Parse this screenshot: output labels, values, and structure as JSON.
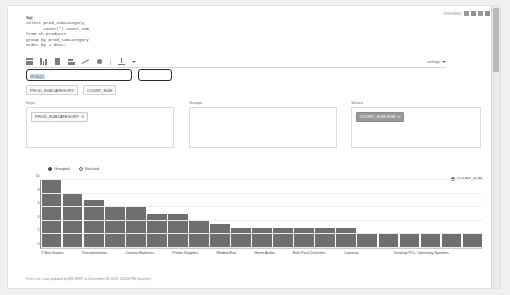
{
  "window": {
    "topbar_label": "FINISHED",
    "icons": [
      "minimize-icon",
      "maximize-icon",
      "close-icon",
      "menu-icon"
    ]
  },
  "sql": {
    "label": "Sql",
    "code": "select prod_subcategory,\n       count(*) count_sum\nfrom sh.products\ngroup by prod_subcategory\norder by 2 desc;"
  },
  "toolbar": {
    "icons": [
      "table-icon",
      "bar-chart-icon",
      "column-chart-icon",
      "stacked-bar-icon",
      "line-chart-icon",
      "pie-chart-icon",
      "download-icon"
    ],
    "settings_label": "settings"
  },
  "inputs": {
    "main_value": "PLSQL",
    "side_value": ""
  },
  "field_chips": [
    "PROD_SUBCATEGORY",
    "COUNT_SUM"
  ],
  "panels": {
    "keys": {
      "title": "Keys",
      "chips": [
        {
          "label": "PROD_SUBCATEGORY",
          "remove": "✕",
          "selected": false
        }
      ]
    },
    "groups": {
      "title": "Groups",
      "chips": []
    },
    "values": {
      "title": "Values",
      "chips": [
        {
          "label": "COUNT_SUM  SUM",
          "remove": "✕",
          "selected": true
        }
      ]
    }
  },
  "chart_controls": {
    "grouped_label": "Grouped",
    "stacked_label": "Stacked",
    "selected": "Grouped"
  },
  "footer": {
    "text": "Print it on. Last updated by MILTERY at December 08 2015, 42533 PM (inactive)"
  },
  "colors": {
    "bar": "#6f6f6f",
    "axis": "#8c8c8c",
    "chip_selected": "#9a9a9a",
    "page": "#ffffff"
  },
  "chart_data": {
    "type": "bar",
    "title": "",
    "xlabel": "",
    "ylabel": "",
    "ylim": [
      0,
      10
    ],
    "yticks": [
      0,
      2,
      4,
      6,
      8,
      10
    ],
    "grid": true,
    "legend": [
      "COUNT_SUM"
    ],
    "legend_position": "top-right",
    "categories": [
      "Y Box Games",
      "",
      "Documentation",
      "",
      "Camera Batteries",
      "",
      "Printer Supplies",
      "",
      "Modem/Fax",
      "",
      "Home Audio",
      "",
      "Bulk Pack Diskettes",
      "",
      "Cameras",
      "",
      "",
      "Desktop PCs",
      "Operating Systems",
      "",
      ""
    ],
    "visible_tick_labels": [
      "Y Box Games",
      "Documentation",
      "Camera Batteries",
      "Printer Supplies",
      "Modem/Fax",
      "Home Audio",
      "Bulk Pack Diskettes",
      "Cameras",
      "Desktop PCs",
      "Operating Systems"
    ],
    "series": [
      {
        "name": "COUNT_SUM",
        "values": [
          10,
          8,
          7,
          6,
          6,
          5,
          5,
          4,
          3.5,
          3,
          3,
          3,
          3,
          3,
          3,
          2,
          2,
          2,
          2,
          2,
          2
        ]
      }
    ]
  }
}
